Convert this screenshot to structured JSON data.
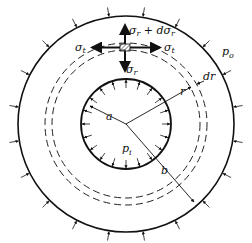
{
  "labels": {
    "sigma_r_plus": "σr + dσr",
    "sigma_r_bottom": "σr",
    "sigma_r_left": "σr",
    "sigma_t": "σt",
    "p_o": "po",
    "dr": "dr",
    "r": "r",
    "a": "a",
    "b": "b",
    "p_i": "pi"
  },
  "geometry": {
    "center": [
      126,
      124
    ],
    "outer_radius": 108,
    "inner_radius": 45,
    "dashed_radii": [
      74,
      81
    ]
  }
}
